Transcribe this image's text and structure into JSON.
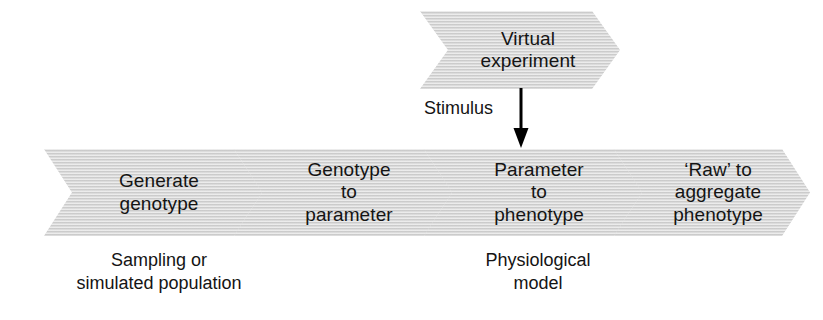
{
  "diagram": {
    "colors": {
      "chevron_fill": "#d4d4d4",
      "text": "#141414",
      "background": "#ffffff",
      "arrow": "#000000"
    },
    "top_stage": {
      "label": "Virtual\nexperiment"
    },
    "connector": {
      "label": "Stimulus",
      "icon": "arrow-down-icon",
      "from": "Virtual experiment",
      "to": "Parameter to phenotype"
    },
    "pipeline": [
      {
        "id": "generate-genotype",
        "label": "Generate\ngenotype",
        "caption": "Sampling or\nsimulated population"
      },
      {
        "id": "genotype-to-parameter",
        "label": "Genotype\nto\nparameter",
        "caption": ""
      },
      {
        "id": "parameter-to-phenotype",
        "label": "Parameter\nto\nphenotype",
        "caption": "Physiological\nmodel"
      },
      {
        "id": "raw-to-aggregate-phenotype",
        "label": "‘Raw’ to\naggregate\nphenotype",
        "caption": ""
      }
    ]
  }
}
